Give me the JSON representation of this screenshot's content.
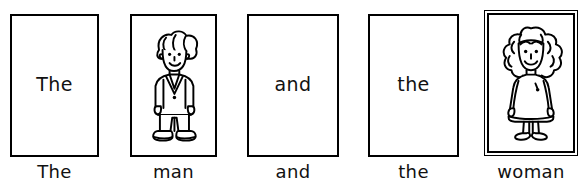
{
  "page": {
    "background_color": "#ffffff",
    "ink_color": "#000000",
    "sentence": "The man and the woman"
  },
  "cards": [
    {
      "index": 1,
      "content_kind": "word",
      "word": "The",
      "caption": "The",
      "frame": "single",
      "x": 10,
      "y": 14,
      "width": 89,
      "height": 143,
      "caption_y": 163
    },
    {
      "index": 2,
      "content_kind": "picture",
      "picture": "man-figure-icon",
      "word": "",
      "caption": "man",
      "frame": "single",
      "x": 130,
      "y": 14,
      "width": 87,
      "height": 143,
      "caption_y": 163
    },
    {
      "index": 3,
      "content_kind": "word",
      "word": "and",
      "caption": "and",
      "frame": "single",
      "x": 247,
      "y": 14,
      "width": 92,
      "height": 143,
      "caption_y": 163
    },
    {
      "index": 4,
      "content_kind": "word",
      "word": "the",
      "caption": "the",
      "frame": "single",
      "x": 368,
      "y": 14,
      "width": 91,
      "height": 143,
      "caption_y": 163
    },
    {
      "index": 5,
      "content_kind": "picture",
      "picture": "woman-figure-icon",
      "word": "",
      "caption": "woman",
      "frame": "double",
      "x": 484,
      "y": 10,
      "width": 94,
      "height": 146,
      "caption_y": 163
    }
  ]
}
